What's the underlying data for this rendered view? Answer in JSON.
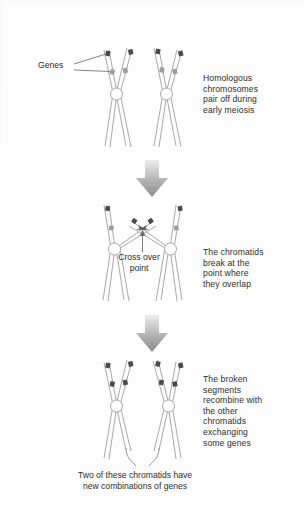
{
  "figure": {
    "type": "biology-diagram"
  },
  "labels": {
    "genes": "Genes",
    "cross_over_point": "Cross over\npoint"
  },
  "notes": {
    "stage1": "Homologous\nchromosomes\npair off during\nearly meiosis",
    "stage2": "The chromatids\nbreak at the\npoint where\nthey overlap",
    "stage3": "The broken\nsegments\nrecombine with\nthe other\nchromatids\nexchanging\nsome genes"
  },
  "caption": "Two of these chromatids have\nnew combinations of genes",
  "icons": {
    "stage_arrow_1": "down-arrow-icon",
    "stage_arrow_2": "down-arrow-icon",
    "break_arrow_left": "arrowhead-icon",
    "break_arrow_right": "arrowhead-icon",
    "pointer_arrow": "up-arrow-icon"
  },
  "colors": {
    "background": "#fdfdfd",
    "outline": "#a9a9a9",
    "gene_dark": "#4a4a4a",
    "gene_light": "#9e9e9e",
    "text": "#2d2d2d",
    "arrow_top": "#e8e8e8",
    "arrow_bottom": "#8f8f8f",
    "leader": "#6f6f6f"
  }
}
